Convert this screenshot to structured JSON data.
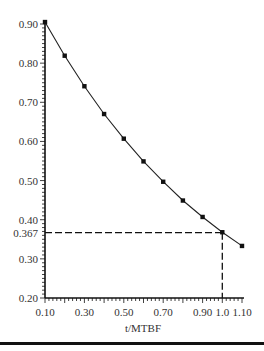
{
  "chart_data": {
    "type": "line",
    "title": "",
    "xlabel": "t/MTBF",
    "ylabel": "",
    "xlim": [
      0.1,
      1.1
    ],
    "ylim": [
      0.2,
      0.9
    ],
    "grid": false,
    "legend": "none",
    "x_tick_labels": [
      "0.10",
      "0.30",
      "0.50",
      "0.70",
      "0.90",
      "1.0",
      "1.10"
    ],
    "x_ticks": [
      0.1,
      0.3,
      0.5,
      0.7,
      0.9,
      1.0,
      1.1
    ],
    "y_tick_labels": [
      "0.20",
      "0.30",
      "0.367",
      "0.40",
      "0.50",
      "0.60",
      "0.70",
      "0.80",
      "0.90"
    ],
    "y_ticks": [
      0.2,
      0.3,
      0.367,
      0.4,
      0.5,
      0.6,
      0.7,
      0.8,
      0.9
    ],
    "series": [
      {
        "name": "Reliability",
        "x": [
          0.1,
          0.2,
          0.3,
          0.4,
          0.5,
          0.6,
          0.7,
          0.8,
          0.9,
          1.0,
          1.1
        ],
        "values": [
          0.905,
          0.819,
          0.741,
          0.67,
          0.607,
          0.549,
          0.497,
          0.449,
          0.407,
          0.368,
          0.333
        ]
      }
    ],
    "annotations": [
      {
        "type": "dashed-hline",
        "y": 0.367,
        "from_x": 0.1,
        "to_x": 1.0
      },
      {
        "type": "dashed-vline",
        "x": 1.0,
        "from_y": 0.2,
        "to_y": 0.367
      }
    ]
  }
}
